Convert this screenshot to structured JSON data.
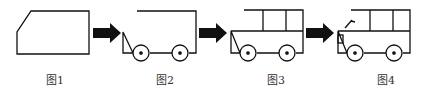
{
  "figures": [
    {
      "label": "图1",
      "stage": "body-outline"
    },
    {
      "label": "图2",
      "stage": "wheels-added"
    },
    {
      "label": "图3",
      "stage": "windows-added"
    },
    {
      "label": "图4",
      "stage": "details-added"
    }
  ],
  "colors": {
    "stroke": "#111111",
    "arrow": "#111111",
    "label": "#333333"
  }
}
